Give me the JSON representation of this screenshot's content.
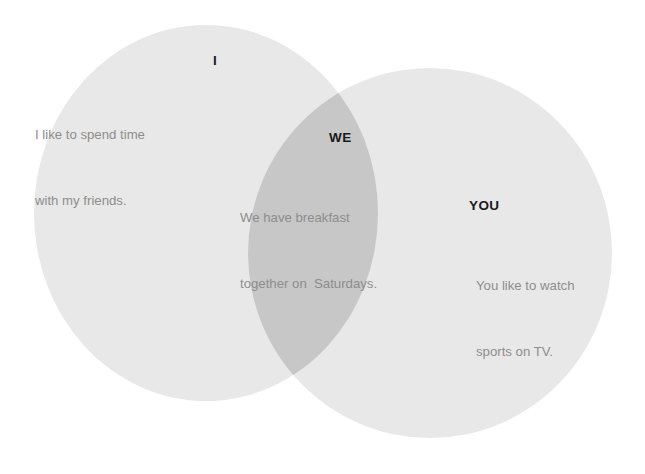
{
  "diagram": {
    "type": "venn-2-set",
    "background_color": "#ffffff",
    "canvas": {
      "width": 645,
      "height": 474
    }
  },
  "colors": {
    "left_circle_fill": "#e8e8e8",
    "right_circle_fill": "#e8e8e8",
    "overlap_fill": "#c7c7c7",
    "title_text": "#1a1a1a",
    "body_text": "#8d8d8d",
    "page_background": "#ffffff"
  },
  "sets": {
    "left": {
      "title": "I",
      "description_lines": [
        "I like to spend time",
        "with my friends."
      ],
      "shape": {
        "cx": 206,
        "cy": 213,
        "rx": 172,
        "ry": 188
      }
    },
    "right": {
      "title": "YOU",
      "description_lines": [
        "You like to watch",
        "sports on TV."
      ],
      "shape": {
        "cx": 430,
        "cy": 253,
        "rx": 182,
        "ry": 185
      }
    },
    "intersection": {
      "title": "WE",
      "description_lines": [
        "We have breakfast",
        "together on  Saturdays."
      ]
    }
  }
}
